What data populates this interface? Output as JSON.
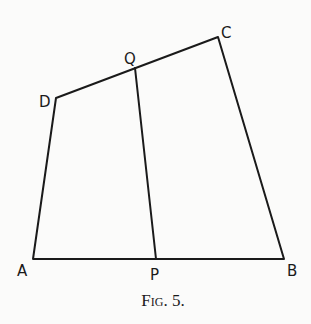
{
  "figure": {
    "caption": "Fig. 5.",
    "points": {
      "A": {
        "label": "A",
        "x": 33,
        "y": 259
      },
      "P": {
        "label": "P",
        "x": 156,
        "y": 259
      },
      "B": {
        "label": "B",
        "x": 284,
        "y": 259
      },
      "D": {
        "label": "D",
        "x": 56,
        "y": 98
      },
      "Q": {
        "label": "Q",
        "x": 135,
        "y": 68
      },
      "C": {
        "label": "C",
        "x": 218,
        "y": 37
      }
    },
    "segments": [
      "AB",
      "BC",
      "CD",
      "DA",
      "PQ"
    ],
    "line_color": "#1a1a1a"
  }
}
